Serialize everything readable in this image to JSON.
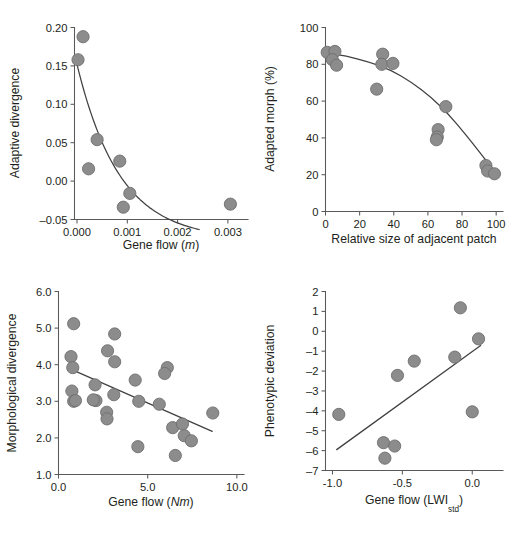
{
  "figure": {
    "name": "four-panel-scatter-figure",
    "marker_color": "#8c8c8c",
    "marker_stroke": "#6e6e6e",
    "line_color": "#404040",
    "axis_color": "#58595b",
    "text_color": "#231f20",
    "background": "#ffffff"
  },
  "chart_data": [
    {
      "panel": "A",
      "type": "scatter",
      "title": "",
      "xlabel": "Gene flow (m)",
      "xlabel_parts": {
        "text": "Gene flow (",
        "italic": "m",
        "tail": ")"
      },
      "ylabel": "Adaptive divergence",
      "xlim": [
        -5e-05,
        0.0034
      ],
      "ylim": [
        -0.05,
        0.2
      ],
      "xticks": [
        0.0,
        0.001,
        0.002,
        0.003
      ],
      "xtick_labels": [
        "0.000",
        "0.001",
        "0.002",
        "0.003"
      ],
      "yticks": [
        -0.05,
        0.0,
        0.05,
        0.1,
        0.15,
        0.2
      ],
      "ytick_labels": [
        "-0.05",
        "0.00",
        "0.05",
        "0.10",
        "0.15",
        "0.20"
      ],
      "grid": false,
      "legend": "none",
      "points": [
        {
          "x": 0.00012,
          "y": 0.188
        },
        {
          "x": 2e-05,
          "y": 0.158
        },
        {
          "x": 0.0004,
          "y": 0.054
        },
        {
          "x": 0.00085,
          "y": 0.026
        },
        {
          "x": 0.00023,
          "y": 0.016
        },
        {
          "x": 0.00105,
          "y": -0.016
        },
        {
          "x": 0.00092,
          "y": -0.034
        },
        {
          "x": 0.00305,
          "y": -0.03
        }
      ],
      "fit": {
        "kind": "decay-curve",
        "description": "negative exponential decline from y=0.152 at x=0 to y=-0.05 near x=0.00243"
      }
    },
    {
      "panel": "B",
      "type": "scatter",
      "title": "",
      "xlabel": "Relative size of adjacent patch",
      "ylabel": "Adapted morph (%)",
      "xlim": [
        0,
        104
      ],
      "ylim": [
        0,
        100
      ],
      "xticks": [
        0,
        20,
        40,
        60,
        80,
        100
      ],
      "xtick_labels": [
        "0",
        "20",
        "40",
        "60",
        "80",
        "100"
      ],
      "yticks": [
        0,
        20,
        40,
        60,
        80,
        100
      ],
      "ytick_labels": [
        "0",
        "20",
        "40",
        "60",
        "80",
        "100"
      ],
      "grid": false,
      "legend": "none",
      "points": [
        {
          "x": 1.0,
          "y": 86.5
        },
        {
          "x": 5.5,
          "y": 87.0
        },
        {
          "x": 4.0,
          "y": 82.5
        },
        {
          "x": 6.5,
          "y": 79.5
        },
        {
          "x": 33.5,
          "y": 85.5
        },
        {
          "x": 33.0,
          "y": 80.0
        },
        {
          "x": 39.5,
          "y": 80.5
        },
        {
          "x": 30.0,
          "y": 66.5
        },
        {
          "x": 70.5,
          "y": 57.0
        },
        {
          "x": 66.0,
          "y": 44.5
        },
        {
          "x": 65.5,
          "y": 40.5
        },
        {
          "x": 65.0,
          "y": 39.0
        },
        {
          "x": 94.0,
          "y": 25.0
        },
        {
          "x": 95.0,
          "y": 22.0
        },
        {
          "x": 99.0,
          "y": 20.5
        }
      ],
      "fit": {
        "kind": "concave-curve",
        "description": "gentle decline from ~86% at x=0 flattening then steepening to ~22% at x=100"
      }
    },
    {
      "panel": "C",
      "type": "scatter",
      "title": "",
      "xlabel": "Gene flow (Nm)",
      "xlabel_parts": {
        "text": "Gene flow (",
        "italic": "Nm",
        "tail": ")"
      },
      "ylabel": "Morphological divergence",
      "xlim": [
        0.0,
        10.4
      ],
      "ylim": [
        1.0,
        6.0
      ],
      "xticks": [
        0.0,
        5.0,
        10.0
      ],
      "xtick_labels": [
        "0.0",
        "5.0",
        "10.0"
      ],
      "yticks": [
        1.0,
        2.0,
        3.0,
        4.0,
        5.0,
        6.0
      ],
      "ytick_labels": [
        "1.0",
        "2.0",
        "3.0",
        "4.0",
        "5.0",
        "6.0"
      ],
      "grid": false,
      "legend": "none",
      "points": [
        {
          "x": 0.85,
          "y": 5.12
        },
        {
          "x": 0.7,
          "y": 4.22
        },
        {
          "x": 0.8,
          "y": 3.92
        },
        {
          "x": 0.75,
          "y": 3.28
        },
        {
          "x": 0.85,
          "y": 3.0
        },
        {
          "x": 0.95,
          "y": 3.02
        },
        {
          "x": 2.05,
          "y": 3.45
        },
        {
          "x": 2.1,
          "y": 3.02
        },
        {
          "x": 1.95,
          "y": 3.04
        },
        {
          "x": 2.75,
          "y": 4.38
        },
        {
          "x": 2.7,
          "y": 2.7
        },
        {
          "x": 2.72,
          "y": 2.52
        },
        {
          "x": 3.15,
          "y": 4.84
        },
        {
          "x": 3.15,
          "y": 4.08
        },
        {
          "x": 3.1,
          "y": 3.18
        },
        {
          "x": 4.3,
          "y": 3.58
        },
        {
          "x": 4.5,
          "y": 3.0
        },
        {
          "x": 4.45,
          "y": 1.76
        },
        {
          "x": 5.65,
          "y": 2.92
        },
        {
          "x": 6.1,
          "y": 3.92
        },
        {
          "x": 5.95,
          "y": 3.76
        },
        {
          "x": 6.4,
          "y": 2.28
        },
        {
          "x": 6.55,
          "y": 1.52
        },
        {
          "x": 6.95,
          "y": 2.38
        },
        {
          "x": 7.05,
          "y": 2.06
        },
        {
          "x": 7.45,
          "y": 1.92
        },
        {
          "x": 8.65,
          "y": 2.68
        }
      ],
      "fit": {
        "kind": "linear",
        "description": "negative linear trend from (0.8, 3.85) to (8.6, 2.18)"
      }
    },
    {
      "panel": "D",
      "type": "scatter",
      "title": "",
      "xlabel": "Gene flow (LWIstd)",
      "xlabel_parts": {
        "text": "Gene flow (LWI",
        "subscript": "std",
        "tail": ")"
      },
      "ylabel": "Phenotypic deviation",
      "xlim": [
        -1.05,
        0.22
      ],
      "ylim": [
        -7,
        2
      ],
      "xticks": [
        -1.0,
        -0.5,
        0.0
      ],
      "xtick_labels": [
        "-1.0",
        "-0.5",
        "0.0"
      ],
      "yticks": [
        -7,
        -6,
        -5,
        -4,
        -3,
        -2,
        -1,
        0,
        1,
        2
      ],
      "ytick_labels": [
        "-7",
        "-6",
        "-5",
        "-4",
        "-3",
        "-2",
        "-1",
        "0",
        "1",
        "2"
      ],
      "grid": false,
      "legend": "none",
      "points": [
        {
          "x": -0.955,
          "y": -4.18
        },
        {
          "x": -0.635,
          "y": -5.6
        },
        {
          "x": -0.625,
          "y": -6.38
        },
        {
          "x": -0.555,
          "y": -5.77
        },
        {
          "x": -0.535,
          "y": -2.22
        },
        {
          "x": -0.415,
          "y": -1.5
        },
        {
          "x": -0.125,
          "y": -1.3
        },
        {
          "x": -0.085,
          "y": 1.18
        },
        {
          "x": 0.0,
          "y": -4.05
        },
        {
          "x": 0.045,
          "y": -0.38
        }
      ],
      "fit": {
        "kind": "linear",
        "description": "positive linear trend from (-0.97, -5.95) to (0.06, -0.72)"
      }
    }
  ]
}
